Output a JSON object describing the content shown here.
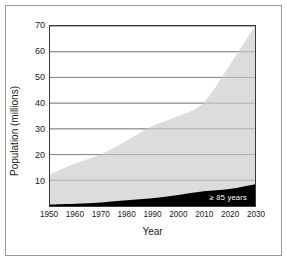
{
  "chart_data": {
    "type": "area",
    "title": "",
    "xlabel": "Year",
    "ylabel": "Population (millions)",
    "xlim": [
      1950,
      2030
    ],
    "ylim": [
      0,
      70
    ],
    "grid": true,
    "grid_axis": "y",
    "legend_position": "inside-bottom-right",
    "stacked": true,
    "x": [
      1950,
      1960,
      1970,
      1980,
      1990,
      2000,
      2010,
      2020,
      2030
    ],
    "xtick_labels": [
      "1950",
      "1960",
      "1970",
      "1980",
      "1990",
      "2000",
      "2010",
      "2020",
      "2030"
    ],
    "ytick_values": [
      10,
      20,
      30,
      40,
      50,
      60,
      70
    ],
    "ytick_labels": [
      "10",
      "20",
      "30",
      "40",
      "50",
      "60",
      "70"
    ],
    "series": [
      {
        "name": "Total older population",
        "color": "#dcdcdc",
        "values": [
          12.3,
          16.6,
          20.1,
          25.5,
          31.1,
          35.0,
          40.2,
          54.6,
          70.0
        ]
      },
      {
        "name": "≥ 85 years",
        "color": "#000000",
        "values": [
          0.6,
          0.9,
          1.4,
          2.2,
          3.0,
          4.3,
          5.7,
          6.6,
          8.5
        ]
      }
    ],
    "legend": [
      {
        "label": "≥ 85 years",
        "color": "#000000",
        "text_color": "#ffffff"
      }
    ]
  },
  "figure": {
    "border_color": "#9a9a9a",
    "background": "#ffffff",
    "axis_color": "#3a3a3a",
    "gridline_color": "#808080"
  }
}
